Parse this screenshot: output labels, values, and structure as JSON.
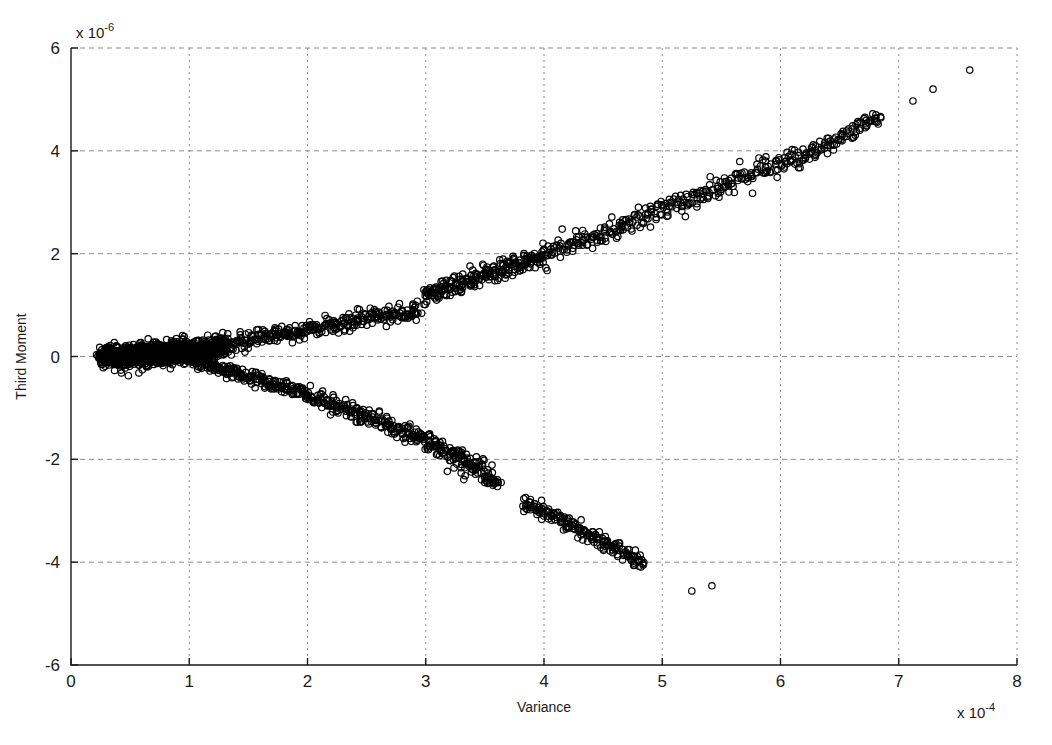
{
  "figure": {
    "background_color": "#ffffff",
    "plot_area": {
      "left": 71,
      "top": 48,
      "right": 1017,
      "bottom": 665
    }
  },
  "chart_data": {
    "type": "scatter",
    "title": "",
    "xlabel": "Variance",
    "ylabel": "Third Moment",
    "x_exponent_label": "x 10",
    "x_exponent_value": "-4",
    "y_exponent_label": "x 10",
    "y_exponent_value": "-6",
    "xlim": [
      0,
      8
    ],
    "ylim": [
      -6,
      6
    ],
    "xticks": [
      0,
      1,
      2,
      3,
      4,
      5,
      6,
      7,
      8
    ],
    "xtick_labels": [
      "0",
      "1",
      "2",
      "3",
      "4",
      "5",
      "6",
      "7",
      "8"
    ],
    "yticks": [
      -6,
      -4,
      -2,
      0,
      2,
      4,
      6
    ],
    "ytick_labels": [
      "-6",
      "-4",
      "-2",
      "0",
      "2",
      "4",
      "6"
    ],
    "grid": true,
    "grid_style": "dashed",
    "grid_color": "#8a8a8a",
    "axis_color": "#1a1a1a",
    "legend": null,
    "marker": {
      "shape": "circle",
      "filled": false,
      "edge_color": "#000000",
      "size_px": 6.4,
      "line_width": 1.2
    },
    "series": [
      {
        "name": "upper-branch",
        "description": "Dense upward band from origin cluster rising to upper right, with a small vertical jump near x=3.0",
        "segments": [
          {
            "x_start": 0.25,
            "x_end": 1.05,
            "y_start": -0.02,
            "y_end": 0.12,
            "count": 420,
            "scatter_y": 0.055,
            "scatter_x": 0.012
          },
          {
            "x_start": 1.05,
            "x_end": 2.95,
            "y_start": 0.12,
            "y_end": 0.92,
            "count": 330,
            "scatter_y": 0.09,
            "scatter_x": 0.012
          },
          {
            "x_start": 2.98,
            "x_end": 4.0,
            "y_start": 1.18,
            "y_end": 1.98,
            "count": 230,
            "scatter_y": 0.1,
            "scatter_x": 0.012
          },
          {
            "x_start": 4.0,
            "x_end": 6.3,
            "y_start": 1.98,
            "y_end": 4.0,
            "count": 300,
            "scatter_y": 0.11,
            "scatter_x": 0.012
          },
          {
            "x_start": 6.3,
            "x_end": 6.85,
            "y_start": 4.0,
            "y_end": 4.68,
            "count": 70,
            "scatter_y": 0.09,
            "scatter_x": 0.012
          }
        ],
        "outliers": [
          {
            "x": 7.12,
            "y": 4.97
          },
          {
            "x": 7.29,
            "y": 5.2
          },
          {
            "x": 7.6,
            "y": 5.57
          }
        ]
      },
      {
        "name": "lower-branch",
        "description": "Downward band separating from origin cluster near x=1.0, descending to lower right with a gap between x=3.6 and x=3.8",
        "segments": [
          {
            "x_start": 1.02,
            "x_end": 2.0,
            "y_start": -0.05,
            "y_end": -0.75,
            "count": 200,
            "scatter_y": 0.07,
            "scatter_x": 0.012
          },
          {
            "x_start": 2.0,
            "x_end": 3.0,
            "y_start": -0.75,
            "y_end": -1.62,
            "count": 190,
            "scatter_y": 0.09,
            "scatter_x": 0.012
          },
          {
            "x_start": 3.0,
            "x_end": 3.62,
            "y_start": -1.62,
            "y_end": -2.45,
            "count": 140,
            "scatter_y": 0.11,
            "scatter_x": 0.014
          },
          {
            "x_start": 3.82,
            "x_end": 4.85,
            "y_start": -2.82,
            "y_end": -4.0,
            "count": 180,
            "scatter_y": 0.08,
            "scatter_x": 0.012
          }
        ],
        "outliers": [
          {
            "x": 5.25,
            "y": -4.56
          },
          {
            "x": 5.42,
            "y": -4.46
          }
        ]
      },
      {
        "name": "origin-cluster",
        "description": "Very dense saturated blob of points near origin",
        "segments": [
          {
            "x_start": 0.25,
            "x_end": 1.3,
            "y_start": -0.02,
            "y_end": 0.16,
            "count": 900,
            "scatter_y": 0.1,
            "scatter_x": 0.02
          },
          {
            "x_start": 0.3,
            "x_end": 0.95,
            "y_start": -0.01,
            "y_end": 0.05,
            "count": 600,
            "scatter_y": 0.07,
            "scatter_x": 0.015
          }
        ],
        "outliers": []
      }
    ]
  }
}
